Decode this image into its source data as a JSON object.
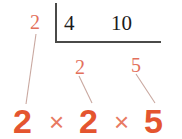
{
  "diagram": {
    "type": "division-ladder-factor-tree",
    "colors": {
      "bracket": "#4a4a48",
      "dividend_text": "#1b1b1b",
      "annotation": "#e3705c",
      "factor_bold": "#e4552f",
      "times_symbol": "#e87a62",
      "connector_line": "#c9a8a0"
    },
    "divisor": {
      "label": "2"
    },
    "dividends": [
      {
        "label": "4"
      },
      {
        "label": "10"
      }
    ],
    "annotations": [
      {
        "label": "2",
        "position": "top-left"
      },
      {
        "label": "2",
        "position": "middle"
      },
      {
        "label": "5",
        "position": "right"
      }
    ],
    "factorization": {
      "factors": [
        "2",
        "2",
        "5"
      ],
      "operator": "×",
      "expression": "2 × 2 × 5"
    },
    "connectors": [
      {
        "from": "annotation-left",
        "to": "factor-1"
      },
      {
        "from": "annotation-mid",
        "to": "factor-2"
      },
      {
        "from": "annotation-right",
        "to": "factor-3"
      }
    ]
  }
}
